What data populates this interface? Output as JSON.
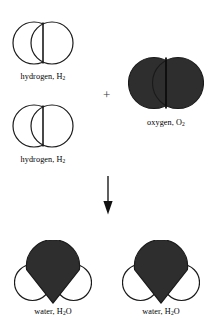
{
  "diagram": {
    "background_color": "#ffffff",
    "stroke_color": "#1a1a1a",
    "atom_dark_color": "#2e2e2e",
    "atom_light_color": "#ffffff",
    "operator": {
      "plus": "+",
      "arrow": "down-arrow"
    },
    "reactants": [
      {
        "id": "hydrogen-1",
        "label_text": "hydrogen, H",
        "label_sub": "2",
        "kind": "diatomic-light"
      },
      {
        "id": "hydrogen-2",
        "label_text": "hydrogen, H",
        "label_sub": "2",
        "kind": "diatomic-light"
      },
      {
        "id": "oxygen-1",
        "label_text": "oxygen, O",
        "label_sub": "2",
        "kind": "diatomic-dark"
      }
    ],
    "products": [
      {
        "id": "water-1",
        "label_prefix": "water, H",
        "label_sub": "2",
        "label_suffix": "O",
        "kind": "triatomic-water"
      },
      {
        "id": "water-2",
        "label_prefix": "water, H",
        "label_sub": "2",
        "label_suffix": "O",
        "kind": "triatomic-water"
      }
    ]
  }
}
